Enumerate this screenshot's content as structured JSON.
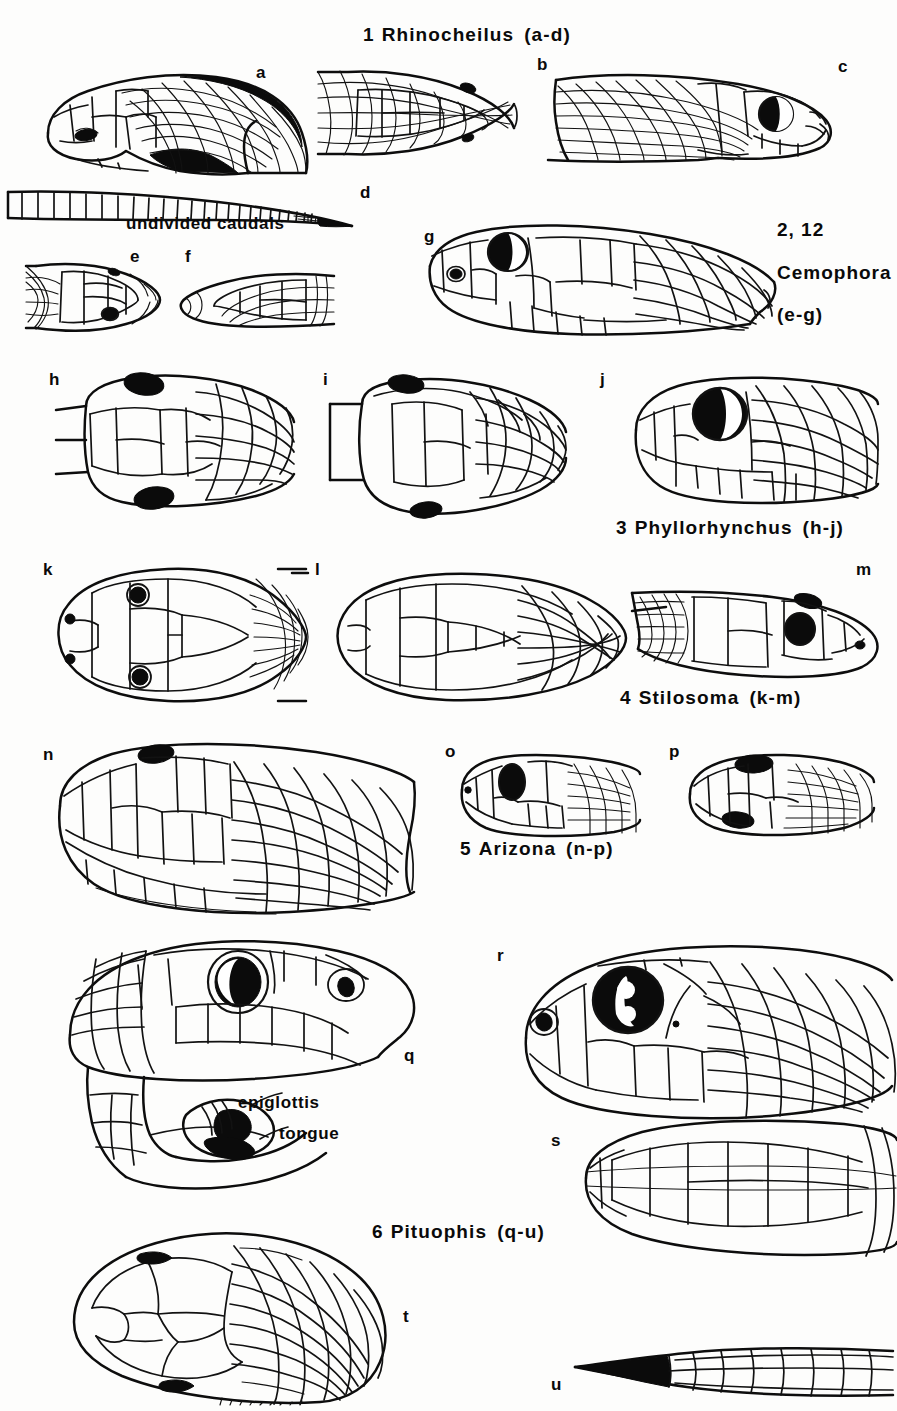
{
  "figure": {
    "type": "scientific-illustration-plate",
    "background_color": "#fdfdfc",
    "ink_color": "#121212"
  },
  "taxa": [
    {
      "number": "1",
      "name": "Rhinocheilus",
      "range": "(a-d)",
      "x": 363,
      "y": 24
    },
    {
      "number": "2, 12",
      "name": "Cemophora",
      "range": "(e-g)",
      "x": 777,
      "y": 219
    },
    {
      "number": "3",
      "name": "Phyllorhynchus",
      "range": "(h-j)",
      "x": 616,
      "y": 517
    },
    {
      "number": "4",
      "name": "Stilosoma",
      "range": "(k-m)",
      "x": 620,
      "y": 687
    },
    {
      "number": "5",
      "name": "Arizona",
      "range": "(n-p)",
      "x": 460,
      "y": 838
    },
    {
      "number": "6",
      "name": "Pituophis",
      "range": "(q-u)",
      "x": 372,
      "y": 1221
    }
  ],
  "sidebar_labels": {
    "cemophora_number": "2, 12",
    "cemophora_name": "Cemophora",
    "cemophora_range": "(e-g)"
  },
  "annotations": [
    {
      "text": "undivided caudals",
      "x": 126,
      "y": 214
    },
    {
      "text": "epiglottis",
      "x": 238,
      "y": 1093
    },
    {
      "text": "tongue",
      "x": 279,
      "y": 1124
    }
  ],
  "panels": [
    {
      "letter": "a",
      "x": 256,
      "y": 63,
      "view": "lateral head and neck, Rhinocheilus"
    },
    {
      "letter": "b",
      "x": 537,
      "y": 55,
      "view": "dorsal head, Rhinocheilus"
    },
    {
      "letter": "c",
      "x": 838,
      "y": 57,
      "view": "lateral head, Rhinocheilus"
    },
    {
      "letter": "d",
      "x": 360,
      "y": 183,
      "view": "tail with undivided caudals, Rhinocheilus"
    },
    {
      "letter": "e",
      "x": 130,
      "y": 247,
      "view": "dorsal head, Cemophora"
    },
    {
      "letter": "f",
      "x": 185,
      "y": 247,
      "view": "ventral head, Cemophora"
    },
    {
      "letter": "g",
      "x": 424,
      "y": 227,
      "view": "lateral head, Cemophora"
    },
    {
      "letter": "h",
      "x": 49,
      "y": 370,
      "view": "dorsal head, Phyllorhynchus"
    },
    {
      "letter": "i",
      "x": 323,
      "y": 370,
      "view": "ventral head, Phyllorhynchus"
    },
    {
      "letter": "j",
      "x": 600,
      "y": 370,
      "view": "lateral head, Phyllorhynchus"
    },
    {
      "letter": "k",
      "x": 43,
      "y": 560,
      "view": "dorsal head, Stilosoma"
    },
    {
      "letter": "l",
      "x": 315,
      "y": 560,
      "view": "ventral head, Stilosoma"
    },
    {
      "letter": "m",
      "x": 856,
      "y": 560,
      "view": "lateral head, Stilosoma"
    },
    {
      "letter": "n",
      "x": 43,
      "y": 745,
      "view": "lateral head, Arizona"
    },
    {
      "letter": "o",
      "x": 445,
      "y": 742,
      "view": "lateral head, Arizona"
    },
    {
      "letter": "p",
      "x": 669,
      "y": 742,
      "view": "dorsal head, Arizona"
    },
    {
      "letter": "q",
      "x": 404,
      "y": 1046,
      "view": "lateral head with open mouth, Pituophis"
    },
    {
      "letter": "r",
      "x": 497,
      "y": 946,
      "view": "lateral head, Pituophis"
    },
    {
      "letter": "s",
      "x": 551,
      "y": 1131,
      "view": "ventral head, Pituophis"
    },
    {
      "letter": "t",
      "x": 403,
      "y": 1307,
      "view": "dorsal head, Pituophis"
    },
    {
      "letter": "u",
      "x": 551,
      "y": 1375,
      "view": "tail tip, Pituophis"
    }
  ]
}
